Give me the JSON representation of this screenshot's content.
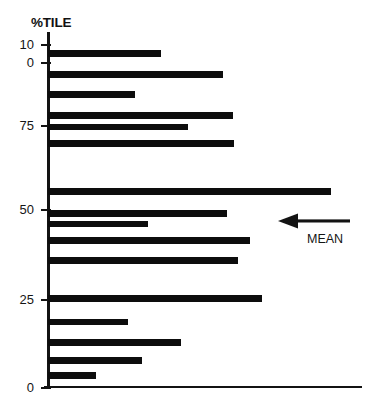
{
  "chart_data": {
    "type": "bar",
    "orientation": "horizontal",
    "title": "%TILE",
    "xlabel": "",
    "ylabel": "%TILE",
    "grid": false,
    "legend": null,
    "yaxis": {
      "tick_labels": [
        "10",
        "0",
        "75",
        "50",
        "25",
        "0"
      ],
      "tick_positions_px": [
        45,
        63,
        126,
        210,
        300,
        388
      ],
      "range": [
        0,
        100
      ]
    },
    "xaxis": {
      "tick_labels": [],
      "range": [
        0,
        100
      ]
    },
    "categories": [
      "bar-1",
      "bar-2",
      "bar-3",
      "bar-4",
      "bar-5",
      "bar-6",
      "bar-7",
      "bar-8",
      "bar-9",
      "bar-10",
      "bar-11",
      "bar-12",
      "bar-13",
      "bar-14",
      "bar-15",
      "bar-16"
    ],
    "values": [
      36,
      56,
      28,
      59,
      45,
      59,
      90,
      57,
      32,
      64,
      60,
      68,
      25,
      42,
      30,
      15
    ],
    "bars": [
      {
        "name": "bar-1",
        "value": 36,
        "top_px": 50,
        "width_px": 113,
        "height_px": 7
      },
      {
        "name": "bar-2",
        "value": 56,
        "top_px": 71,
        "width_px": 175,
        "height_px": 7
      },
      {
        "name": "bar-3",
        "value": 28,
        "top_px": 91,
        "width_px": 87,
        "height_px": 7
      },
      {
        "name": "bar-4",
        "value": 59,
        "top_px": 112,
        "width_px": 185,
        "height_px": 7
      },
      {
        "name": "bar-5",
        "value": 45,
        "top_px": 124,
        "width_px": 140,
        "height_px": 6
      },
      {
        "name": "bar-6",
        "value": 59,
        "top_px": 140,
        "width_px": 186,
        "height_px": 7
      },
      {
        "name": "bar-7",
        "value": 90,
        "top_px": 188,
        "width_px": 283,
        "height_px": 7
      },
      {
        "name": "bar-8",
        "value": 57,
        "top_px": 210,
        "width_px": 179,
        "height_px": 7
      },
      {
        "name": "bar-9",
        "value": 32,
        "top_px": 221,
        "width_px": 100,
        "height_px": 6
      },
      {
        "name": "bar-10",
        "value": 64,
        "top_px": 237,
        "width_px": 202,
        "height_px": 7
      },
      {
        "name": "bar-11",
        "value": 60,
        "top_px": 257,
        "width_px": 190,
        "height_px": 7
      },
      {
        "name": "bar-12",
        "value": 68,
        "top_px": 295,
        "width_px": 214,
        "height_px": 7
      },
      {
        "name": "bar-13",
        "value": 25,
        "top_px": 319,
        "width_px": 80,
        "height_px": 6
      },
      {
        "name": "bar-14",
        "value": 42,
        "top_px": 339,
        "width_px": 133,
        "height_px": 7
      },
      {
        "name": "bar-15",
        "value": 30,
        "top_px": 357,
        "width_px": 94,
        "height_px": 7
      },
      {
        "name": "bar-16",
        "value": 15,
        "top_px": 372,
        "width_px": 48,
        "height_px": 7
      }
    ],
    "annotations": [
      {
        "name": "mean-marker",
        "label": "MEAN",
        "icon": "arrow-left-icon",
        "points_to_px": {
          "x": 278,
          "y": 222
        }
      }
    ],
    "colors": {
      "bar": "#0d0d0d",
      "axis": "#131313",
      "text": "#151515",
      "background": "#ffffff"
    }
  }
}
